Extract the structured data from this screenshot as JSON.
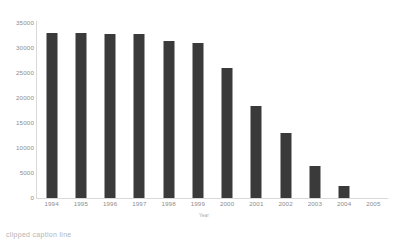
{
  "chart_data": {
    "type": "bar",
    "title": "",
    "subtitle": "",
    "xlabel": "Year",
    "ylabel": "",
    "categories": [
      "1994",
      "1995",
      "1996",
      "1997",
      "1998",
      "1999",
      "2000",
      "2001",
      "2002",
      "2003",
      "2004",
      "2005"
    ],
    "values": [
      33000,
      33000,
      32800,
      32800,
      31500,
      31000,
      26000,
      18500,
      13000,
      6500,
      2500,
      0
    ],
    "ylim": [
      0,
      35000
    ],
    "yticks": [
      0,
      5000,
      10000,
      15000,
      20000,
      25000,
      30000,
      35000
    ],
    "ytick_labels": [
      "0",
      "5000",
      "10000",
      "15000",
      "20000",
      "25000",
      "30000",
      "35000"
    ],
    "grid": false,
    "legend": null,
    "legend_position": "none",
    "bar_color": "#3a3a3a",
    "axis_color": "#d9d9d9",
    "tick_label_color": "#8c8c8c"
  },
  "caption": {
    "text": "clipped caption line"
  }
}
